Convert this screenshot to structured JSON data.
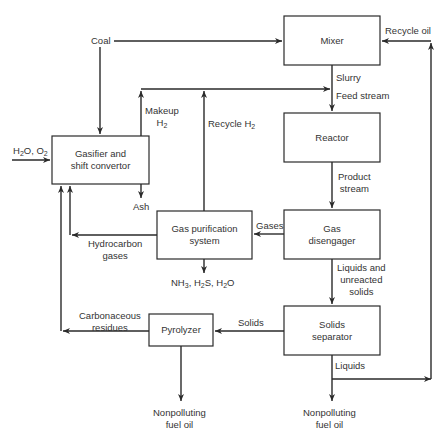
{
  "diagram": {
    "nodes": {
      "mixer": "Mixer",
      "reactor": "Reactor",
      "gas_disengager": "Gas disengager",
      "solids_separator": "Solids separator",
      "gasifier": "Gasifier and shift convertor",
      "gas_purification": "Gas purification system",
      "pyrolyzer": "Pyrolyzer"
    },
    "node_lines": {
      "gas_disengager": [
        "Gas",
        "disengager"
      ],
      "solids_separator": [
        "Solids",
        "separator"
      ],
      "gasifier": [
        "Gasifier and",
        "shift convertor"
      ],
      "gas_purification": [
        "Gas purification",
        "system"
      ]
    },
    "streams": {
      "coal": "Coal",
      "recycle_oil": "Recycle oil",
      "slurry": "Slurry",
      "feed_stream": "Feed stream",
      "product_stream": [
        "Product",
        "stream"
      ],
      "gases": "Gases",
      "liquids_unreacted": [
        "Liquids and",
        "unreacted",
        "solids"
      ],
      "solids": "Solids",
      "liquids": "Liquids",
      "nonpolluting_right": [
        "Nonpolluting",
        "fuel oil"
      ],
      "nonpolluting_left": [
        "Nonpolluting",
        "fuel oil"
      ],
      "makeup_h2": [
        "Makeup",
        "H",
        "2"
      ],
      "recycle_h2": [
        "Recycle H",
        "2"
      ],
      "h2o_o2": [
        "H",
        "2",
        "O, O",
        "2"
      ],
      "ash": "Ash",
      "hydrocarbon_gases": [
        "Hydrocarbon",
        "gases"
      ],
      "byproducts": [
        "NH",
        "3",
        ", H",
        "2",
        "S, H",
        "2",
        "O"
      ],
      "carbonaceous_residues": [
        "Carbonaceous",
        "residues"
      ]
    },
    "edges": [
      {
        "from": "Coal",
        "to": "Mixer"
      },
      {
        "from": "Coal",
        "to": "Gasifier and shift convertor"
      },
      {
        "from": "Recycle oil",
        "to": "Mixer"
      },
      {
        "from": "Mixer",
        "to": "Reactor",
        "label": "Slurry / Feed stream"
      },
      {
        "from": "Makeup H2 + Recycle H2",
        "to": "Feed stream"
      },
      {
        "from": "Reactor",
        "to": "Gas disengager",
        "label": "Product stream"
      },
      {
        "from": "Gas disengager",
        "to": "Gas purification system",
        "label": "Gases"
      },
      {
        "from": "Gas disengager",
        "to": "Solids separator",
        "label": "Liquids and unreacted solids"
      },
      {
        "from": "Solids separator",
        "to": "Pyrolyzer",
        "label": "Solids"
      },
      {
        "from": "Solids separator",
        "to": "Nonpolluting fuel oil",
        "label": "Liquids"
      },
      {
        "from": "Liquids",
        "to": "Recycle oil"
      },
      {
        "from": "Pyrolyzer",
        "to": "Nonpolluting fuel oil"
      },
      {
        "from": "Pyrolyzer",
        "to": "Gasifier and shift convertor",
        "label": "Carbonaceous residues"
      },
      {
        "from": "Gas purification system",
        "to": "Gasifier and shift convertor",
        "label": "Hydrocarbon gases"
      },
      {
        "from": "Gas purification system",
        "to": "NH3, H2S, H2O"
      },
      {
        "from": "Gas purification system",
        "to": "Feed stream",
        "label": "Recycle H2"
      },
      {
        "from": "Gasifier and shift convertor",
        "to": "Feed stream",
        "label": "Makeup H2"
      },
      {
        "from": "Gasifier and shift convertor",
        "to": "Ash"
      },
      {
        "from": "H2O, O2",
        "to": "Gasifier and shift convertor"
      }
    ]
  }
}
